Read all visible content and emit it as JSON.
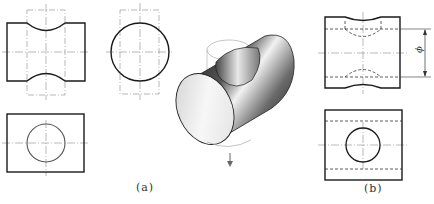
{
  "figure": {
    "subfigures": [
      {
        "id": "a",
        "label": "(a)",
        "views": [
          "front-view",
          "side-view",
          "top-view",
          "isometric-view"
        ],
        "description": "Cylinder with transverse through-hole drawn with phantom outline of cutting cylinder"
      },
      {
        "id": "b",
        "label": "(b)",
        "views": [
          "front-view",
          "top-view"
        ],
        "dimension": {
          "symbol": "ϕ",
          "orientation": "vertical"
        },
        "description": "Cylinder with hole shown with hidden lines and diameter dimension"
      }
    ],
    "arrow": {
      "direction": "down"
    }
  },
  "colors": {
    "outline": "#1a1a1a",
    "centerline": "#8a8a8a",
    "phantom": "#9a9a9a",
    "hidden": "#333333"
  }
}
